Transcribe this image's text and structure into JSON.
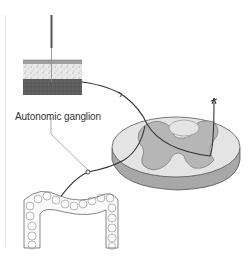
{
  "diagram": {
    "labels": {
      "ganglion": "Autonomic ganglion"
    },
    "components": [
      {
        "id": "skin",
        "name": "Skin tissue block with needle"
      },
      {
        "id": "spinal-cord",
        "name": "Spinal cord cross-section"
      },
      {
        "id": "colon",
        "name": "Large intestine (colon)"
      },
      {
        "id": "afferent-skin",
        "name": "Somatic afferent fiber from skin"
      },
      {
        "id": "afferent-viscera",
        "name": "Visceral afferent fiber via autonomic ganglion"
      },
      {
        "id": "ascending-tract",
        "name": "Ascending tract"
      }
    ],
    "colors": {
      "line": "#333333",
      "cord_white": "#e6e6e6",
      "cord_grey": "#b8b8b8",
      "cord_side": "#a8a8a8",
      "skin_top": "#9a9a9a",
      "skin_mid": "#e8e8e8",
      "skin_bottom": "#5a5a5a"
    }
  }
}
